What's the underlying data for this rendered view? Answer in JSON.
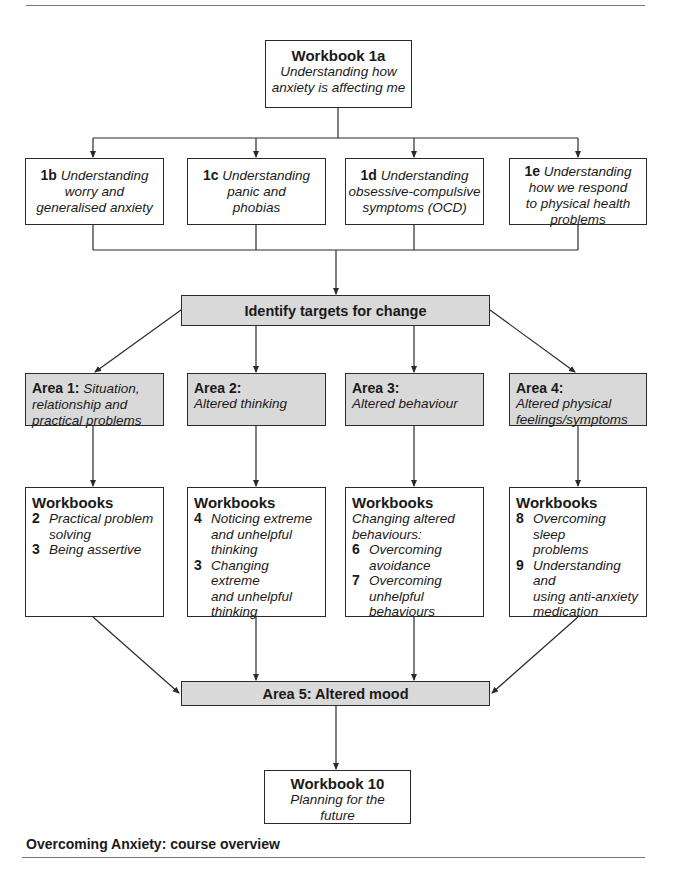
{
  "figure": {
    "caption": "Overcoming Anxiety: course overview"
  },
  "top_box": {
    "title": "Workbook 1a",
    "subtitle_line1": "Understanding how",
    "subtitle_line2": "anxiety is affecting me"
  },
  "sub_workbooks": [
    {
      "code": "1b",
      "lines": [
        "Understanding",
        "worry and",
        "generalised anxiety"
      ]
    },
    {
      "code": "1c",
      "lines": [
        "Understanding",
        "panic and",
        "phobias"
      ]
    },
    {
      "code": "1d",
      "lines": [
        "Understanding",
        "obsessive-compulsive",
        "symptoms (OCD)"
      ]
    },
    {
      "code": "1e",
      "lines": [
        "Understanding",
        "how we respond",
        "to physical health",
        "problems"
      ]
    }
  ],
  "targets_box": {
    "label": "Identify targets for change"
  },
  "areas": [
    {
      "label": "Area 1:",
      "desc_first": "Situation,",
      "desc_rest": [
        "relationship and",
        "practical problems"
      ]
    },
    {
      "label": "Area 2:",
      "desc_first": "",
      "desc_rest": [
        "Altered thinking"
      ]
    },
    {
      "label": "Area 3:",
      "desc_first": "",
      "desc_rest": [
        "Altered behaviour"
      ]
    },
    {
      "label": "Area 4:",
      "desc_first": "",
      "desc_rest": [
        "Altered physical",
        "feelings/symptoms"
      ]
    }
  ],
  "workbook_groups": [
    {
      "header": "Workbooks",
      "note": "",
      "items": [
        {
          "num": "2",
          "lines": [
            "Practical problem",
            "solving"
          ]
        },
        {
          "num": "3",
          "lines": [
            "Being assertive"
          ]
        }
      ]
    },
    {
      "header": "Workbooks",
      "note": "",
      "items": [
        {
          "num": "4",
          "lines": [
            "Noticing extreme",
            "and unhelpful",
            "thinking"
          ]
        },
        {
          "num": "3",
          "lines": [
            "Changing extreme",
            "and unhelpful",
            "thinking"
          ]
        }
      ]
    },
    {
      "header": "Workbooks",
      "note": "Changing altered behaviours:",
      "items": [
        {
          "num": "6",
          "lines": [
            "Overcoming",
            "avoidance"
          ]
        },
        {
          "num": "7",
          "lines": [
            "Overcoming",
            "unhelpful behaviours"
          ]
        }
      ]
    },
    {
      "header": "Workbooks",
      "note": "",
      "items": [
        {
          "num": "8",
          "lines": [
            "Overcoming sleep",
            "problems"
          ]
        },
        {
          "num": "9",
          "lines": [
            "Understanding and",
            "using anti-anxiety",
            "medication"
          ]
        }
      ]
    }
  ],
  "mood_box": {
    "label": "Area 5: Altered mood"
  },
  "final_box": {
    "title": "Workbook 10",
    "subtitle_line1": "Planning for the",
    "subtitle_line2": "future"
  },
  "colors": {
    "box_fill_grey": "#d9d9d9",
    "line": "#2a2a2a"
  }
}
